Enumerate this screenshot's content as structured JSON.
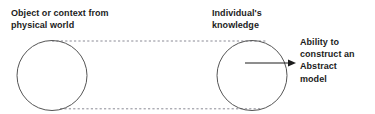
{
  "diagram": {
    "type": "concept-diagram",
    "title_visible": false,
    "background_color": "#ffffff",
    "stroke_color": "#555555",
    "dashed_stroke_color": "#8a8a95",
    "text_color": "#1c1c1c",
    "labels": {
      "object_context": "Object or context from\nphysical world",
      "individual_knowledge": "Individual's\nknowledge",
      "ability_abstract_model": "Ability to\nconstruct an\nAbstract\nmodel"
    },
    "shapes": [
      {
        "name": "left-circle",
        "role": "object-or-context-circle",
        "cx": 52,
        "cy": 75.5,
        "r": 35
      },
      {
        "name": "right-circle",
        "role": "individual-knowledge-circle",
        "cx": 252,
        "cy": 75.5,
        "r": 35
      }
    ],
    "connectors": [
      {
        "name": "top-dashed-connector",
        "style": "dashed",
        "x1": 52,
        "y1": 41,
        "x2": 266,
        "y2": 41
      },
      {
        "name": "bottom-dashed-connector",
        "style": "dashed",
        "x1": 60,
        "y1": 109,
        "x2": 260,
        "y2": 109
      },
      {
        "name": "output-arrow",
        "style": "solid-arrow",
        "x1": 245,
        "y1": 63,
        "x2": 296,
        "y2": 63
      }
    ]
  }
}
